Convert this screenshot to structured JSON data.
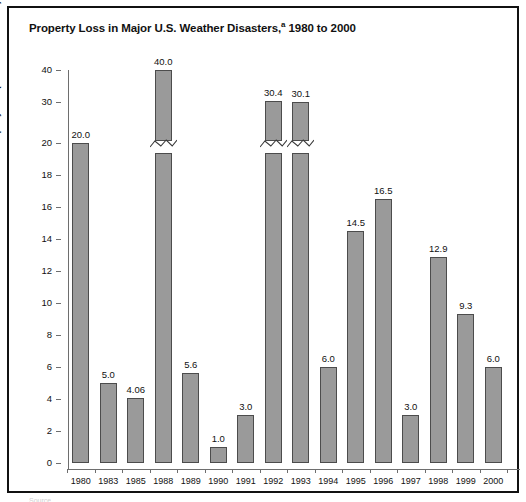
{
  "figure": {
    "title_main": "Property Loss in Major U.S. Weather Disasters,",
    "title_superscript": "a",
    "title_suffix": " 1980 to 2000",
    "frame_color": "#111111",
    "bar_fill_color": "#9a9a9a",
    "bar_edge_color": "#4c4c4c",
    "axis_color": "#6e6e6e"
  },
  "chart_data": {
    "type": "bar",
    "title": "Property Loss in Major U.S. Weather Disasters,a 1980 to 2000",
    "xlabel": "",
    "ylabel": "Property loss (in billions of dollars)",
    "categories": [
      "1980",
      "1983",
      "1985",
      "1988",
      "1989",
      "1990",
      "1991",
      "1992",
      "1993",
      "1994",
      "1995",
      "1996",
      "1997",
      "1998",
      "1999",
      "2000"
    ],
    "values": [
      20.0,
      5.0,
      4.06,
      40.0,
      5.6,
      1.0,
      3.0,
      30.4,
      30.1,
      6.0,
      14.5,
      16.5,
      3.0,
      12.9,
      9.3,
      6.0
    ],
    "value_labels": [
      "20.0",
      "5.0",
      "4.06",
      "40.0",
      "5.6",
      "1.0",
      "3.0",
      "30.4",
      "30.1",
      "6.0",
      "14.5",
      "16.5",
      "3.0",
      "12.9",
      "9.3",
      "6.0"
    ],
    "broken_axis": true,
    "break_above": 20,
    "bars_with_break_mark": [
      "1988",
      "1992",
      "1993"
    ],
    "ytick_labels": [
      "0",
      "2",
      "4",
      "6",
      "8",
      "10",
      "12",
      "14",
      "16",
      "18",
      "20",
      "30",
      "40"
    ],
    "ytick_values": [
      0,
      2,
      4,
      6,
      8,
      10,
      12,
      14,
      16,
      18,
      20,
      30,
      40
    ],
    "ylim": [
      0,
      40
    ],
    "grid": false,
    "legend": null
  },
  "bottom_cut_text": "Source"
}
